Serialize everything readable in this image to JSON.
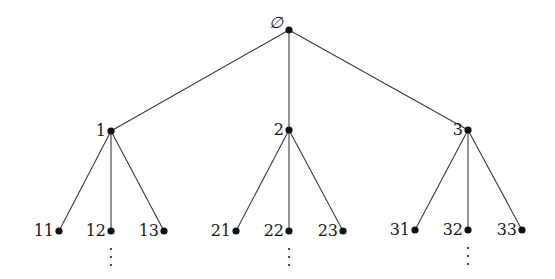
{
  "diagram": {
    "type": "tree",
    "root": {
      "id": "root",
      "label": "∅",
      "x": 289,
      "y": 30
    },
    "level1": [
      {
        "id": "n1",
        "label": "1",
        "x": 111,
        "y": 131
      },
      {
        "id": "n2",
        "label": "2",
        "x": 289,
        "y": 130
      },
      {
        "id": "n3",
        "label": "3",
        "x": 468,
        "y": 130
      }
    ],
    "level2": [
      {
        "id": "n11",
        "label": "11",
        "parent": "n1",
        "x": 59,
        "y": 231
      },
      {
        "id": "n12",
        "label": "12",
        "parent": "n1",
        "x": 111,
        "y": 231
      },
      {
        "id": "n13",
        "label": "13",
        "parent": "n1",
        "x": 164,
        "y": 231
      },
      {
        "id": "n21",
        "label": "21",
        "parent": "n2",
        "x": 236,
        "y": 231
      },
      {
        "id": "n22",
        "label": "22",
        "parent": "n2",
        "x": 289,
        "y": 231
      },
      {
        "id": "n23",
        "label": "23",
        "parent": "n2",
        "x": 343,
        "y": 231
      },
      {
        "id": "n31",
        "label": "31",
        "parent": "n3",
        "x": 415,
        "y": 230
      },
      {
        "id": "n32",
        "label": "32",
        "parent": "n3",
        "x": 468,
        "y": 230
      },
      {
        "id": "n33",
        "label": "33",
        "parent": "n3",
        "x": 522,
        "y": 230
      }
    ],
    "continuation_markers": [
      {
        "below": "n12",
        "symbol": "⋮",
        "x": 111
      },
      {
        "below": "n22",
        "symbol": "⋮",
        "x": 289
      },
      {
        "below": "n32",
        "symbol": "⋮",
        "x": 468
      }
    ],
    "colors": {
      "edge": "#3c3c3c",
      "node": "#111111",
      "text": "#1a1a1a",
      "background": "#ffffff"
    }
  }
}
